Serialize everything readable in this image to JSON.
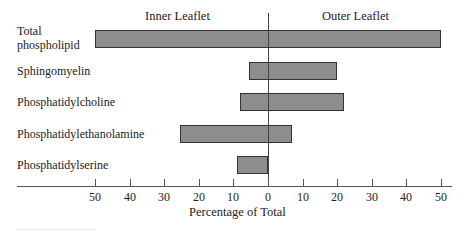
{
  "chart_data": {
    "type": "bar",
    "orientation": "horizontal-diverging",
    "title": "",
    "xlabel": "Percentage of Total",
    "ylabel": "",
    "section_labels": {
      "left": "Inner Leaflet",
      "right": "Outer Leaflet"
    },
    "categories": [
      "Total phospholipid",
      "Sphingomyelin",
      "Phosphatidylcholine",
      "Phosphatidylethanolamine",
      "Phosphatidylserine"
    ],
    "series": [
      {
        "name": "Inner Leaflet",
        "values": [
          50,
          5.5,
          8,
          25.5,
          9
        ]
      },
      {
        "name": "Outer Leaflet",
        "values": [
          50,
          20,
          22,
          7,
          0
        ]
      }
    ],
    "xlim": [
      -50,
      50
    ],
    "xticks": [
      50,
      40,
      30,
      20,
      10,
      0,
      10,
      20,
      30,
      40,
      50
    ],
    "grid": false,
    "legend": "none",
    "bar_color": "#8d8d8d"
  },
  "labels": {
    "inner": "Inner Leaflet",
    "outer": "Outer Leaflet",
    "xlabel": "Percentage of Total",
    "cat0_line1": "Total",
    "cat0_line2": "phospholipid",
    "cat1": "Sphingomyelin",
    "cat2": "Phosphatidylcholine",
    "cat3": "Phosphatidylethanolamine",
    "cat4": "Phosphatidylserine"
  },
  "ticks": [
    "50",
    "40",
    "30",
    "20",
    "10",
    "0",
    "10",
    "20",
    "30",
    "40",
    "50"
  ]
}
